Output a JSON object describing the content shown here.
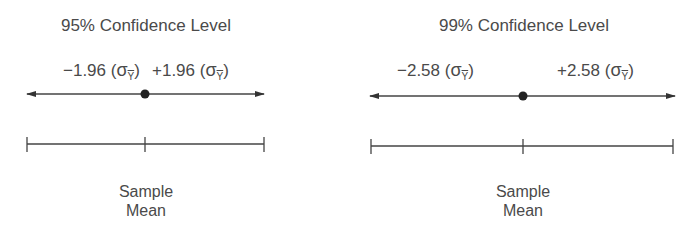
{
  "panels": [
    {
      "title": "95% Confidence Level",
      "z_left": "−1.96",
      "z_right": "+1.96",
      "sigma": "σ",
      "subscript": "Y",
      "mean_label_line1": "Sample",
      "mean_label_line2": "Mean"
    },
    {
      "title": "99% Confidence Level",
      "z_left": "−2.58",
      "z_right": "+2.58",
      "sigma": "σ",
      "subscript": "Y",
      "mean_label_line1": "Sample",
      "mean_label_line2": "Mean"
    }
  ],
  "colors": {
    "line": "#3a3a3a",
    "text": "#4a4a4a"
  }
}
